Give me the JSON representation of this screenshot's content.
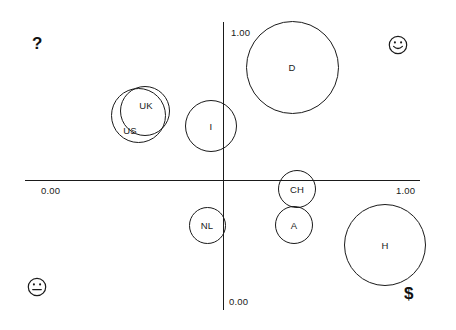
{
  "chart_data": {
    "type": "scatter",
    "title": "",
    "subtitle": "",
    "xlabel": "",
    "ylabel": "",
    "xlim": [
      0.0,
      1.0
    ],
    "ylim": [
      0.0,
      1.0
    ],
    "grid": false,
    "legend": "none",
    "axis_ticks": {
      "y_top": "1.00",
      "y_bottom": "0.00",
      "x_left": "0.00",
      "x_right": "1.00"
    },
    "quadrant_annotations": [
      {
        "id": "upper-left",
        "glyph": "?",
        "icon": "question-mark"
      },
      {
        "id": "upper-right",
        "glyph": "☺",
        "icon": "happy-face-icon"
      },
      {
        "id": "lower-left",
        "glyph": "☹",
        "icon": "neutral-face-icon"
      },
      {
        "id": "lower-right",
        "glyph": "$",
        "icon": "dollar-sign"
      }
    ],
    "bubbles": [
      {
        "label": "D",
        "x": 0.175,
        "y": 0.86,
        "size": 93,
        "cx": 292,
        "cy": 67,
        "d": 93
      },
      {
        "label": "I",
        "x": -0.06,
        "y": 0.43,
        "size": 52,
        "cx": 211,
        "cy": 126,
        "d": 52
      },
      {
        "label": "UK",
        "x": -0.28,
        "y": 0.53,
        "size": 50,
        "cx": 145,
        "cy": 111,
        "d": 50
      },
      {
        "label": "US",
        "x": -0.35,
        "y": 0.49,
        "size": 55,
        "cx": 138,
        "cy": 115,
        "d": 55
      },
      {
        "label": "CH",
        "x": 0.185,
        "y": 0.01,
        "size": 38,
        "cx": 297,
        "cy": 189,
        "d": 38
      },
      {
        "label": "A",
        "x": 0.175,
        "y": -0.12,
        "size": 38,
        "cx": 294,
        "cy": 225,
        "d": 38
      },
      {
        "label": "NL",
        "x": -0.04,
        "y": -0.12,
        "size": 37,
        "cx": 207,
        "cy": 225,
        "d": 37
      },
      {
        "label": "H",
        "x": 0.46,
        "y": -0.3,
        "size": 82,
        "cx": 385,
        "cy": 245,
        "d": 82
      }
    ]
  },
  "glyphs": {
    "question": "?",
    "dollar": "$"
  }
}
